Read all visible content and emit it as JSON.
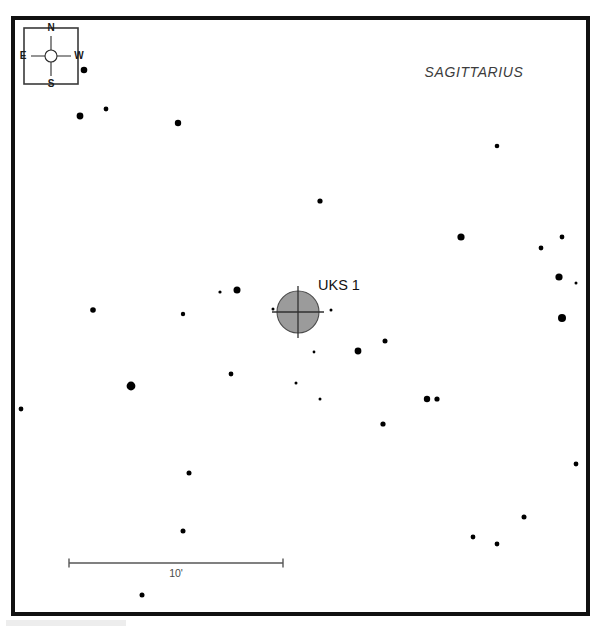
{
  "chart_data": {
    "type": "scatter",
    "constellation": "SAGITTARIUS",
    "xlabel": "",
    "ylabel": "",
    "grid": false,
    "legend_position": "none",
    "field_pixel_box": {
      "x": 13,
      "y": 18,
      "width": 575,
      "height": 596
    },
    "scale_bar": {
      "label": "10'",
      "arcmin": 10,
      "x_start": 69,
      "x_end": 283,
      "y": 563,
      "tick_height": 9,
      "label_x": 176,
      "label_y": 577
    },
    "compass": {
      "box": {
        "x": 24,
        "y": 28,
        "width": 54,
        "height": 56
      },
      "center_x": 51,
      "center_y": 56,
      "circle_radius": 6,
      "arm_length": 20,
      "north_label": "N",
      "south_label": "S",
      "east_label": "E",
      "west_label": "W",
      "north_on_top": true,
      "east_on_left": true
    },
    "target_object": {
      "name": "UKS 1",
      "symbol": "globular-cluster",
      "center_x": 298,
      "center_y": 312,
      "radius": 21,
      "fill_color": "#9b9b9b",
      "cross_overhang": 5,
      "label_x": 318,
      "label_y": 290
    },
    "constellation_label": {
      "x": 474,
      "y": 77
    },
    "star_magnitude_radii": {
      "tiny": 1.3,
      "small": 2.4,
      "medium": 3.3,
      "large": 4.4
    },
    "stars": [
      {
        "x": 84,
        "y": 70,
        "r": 3.3,
        "size": "medium"
      },
      {
        "x": 80,
        "y": 116,
        "r": 3.4,
        "size": "medium"
      },
      {
        "x": 106,
        "y": 109,
        "r": 2.4,
        "size": "small"
      },
      {
        "x": 178,
        "y": 123,
        "r": 3.2,
        "size": "medium"
      },
      {
        "x": 497,
        "y": 146,
        "r": 2.3,
        "size": "small"
      },
      {
        "x": 320,
        "y": 201,
        "r": 2.6,
        "size": "small"
      },
      {
        "x": 461,
        "y": 237,
        "r": 3.6,
        "size": "medium"
      },
      {
        "x": 562,
        "y": 237,
        "r": 2.4,
        "size": "small"
      },
      {
        "x": 541,
        "y": 248,
        "r": 2.4,
        "size": "small"
      },
      {
        "x": 559,
        "y": 277,
        "r": 3.6,
        "size": "medium"
      },
      {
        "x": 576,
        "y": 283,
        "r": 1.5,
        "size": "tiny"
      },
      {
        "x": 220,
        "y": 292,
        "r": 1.6,
        "size": "tiny"
      },
      {
        "x": 237,
        "y": 290,
        "r": 3.5,
        "size": "medium"
      },
      {
        "x": 93,
        "y": 310,
        "r": 2.8,
        "size": "small"
      },
      {
        "x": 183,
        "y": 314,
        "r": 2.2,
        "size": "small"
      },
      {
        "x": 273,
        "y": 309,
        "r": 1.5,
        "size": "tiny"
      },
      {
        "x": 331,
        "y": 310,
        "r": 1.5,
        "size": "tiny"
      },
      {
        "x": 562,
        "y": 318,
        "r": 4.0,
        "size": "medium"
      },
      {
        "x": 314,
        "y": 352,
        "r": 1.4,
        "size": "tiny"
      },
      {
        "x": 385,
        "y": 341,
        "r": 2.5,
        "size": "small"
      },
      {
        "x": 358,
        "y": 351,
        "r": 3.4,
        "size": "medium"
      },
      {
        "x": 231,
        "y": 374,
        "r": 2.4,
        "size": "small"
      },
      {
        "x": 131,
        "y": 386,
        "r": 4.4,
        "size": "large"
      },
      {
        "x": 296,
        "y": 383,
        "r": 1.5,
        "size": "tiny"
      },
      {
        "x": 320,
        "y": 399,
        "r": 1.5,
        "size": "tiny"
      },
      {
        "x": 427,
        "y": 399,
        "r": 3.2,
        "size": "medium"
      },
      {
        "x": 437,
        "y": 399,
        "r": 2.6,
        "size": "small"
      },
      {
        "x": 21,
        "y": 409,
        "r": 2.4,
        "size": "small"
      },
      {
        "x": 383,
        "y": 424,
        "r": 2.6,
        "size": "small"
      },
      {
        "x": 576,
        "y": 464,
        "r": 2.4,
        "size": "small"
      },
      {
        "x": 189,
        "y": 473,
        "r": 2.5,
        "size": "small"
      },
      {
        "x": 524,
        "y": 517,
        "r": 2.5,
        "size": "small"
      },
      {
        "x": 183,
        "y": 531,
        "r": 2.5,
        "size": "small"
      },
      {
        "x": 473,
        "y": 537,
        "r": 2.4,
        "size": "small"
      },
      {
        "x": 497,
        "y": 544,
        "r": 2.4,
        "size": "small"
      },
      {
        "x": 142,
        "y": 595,
        "r": 2.5,
        "size": "small"
      }
    ]
  },
  "colors": {
    "frame": "#111111",
    "background": "#ffffff",
    "star": "#000000",
    "object_fill": "#9b9b9b",
    "object_stroke": "#4a4a4a",
    "text": "#1a1a1a",
    "constellation_text": "#3c3c3c",
    "scalebar": "#565656"
  }
}
